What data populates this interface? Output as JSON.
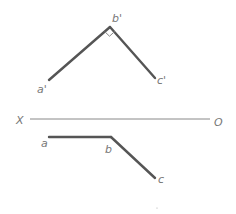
{
  "diagram": {
    "type": "orthographic projection",
    "front_view": {
      "points": [
        {
          "label": "a'",
          "x": 49,
          "y": 80
        },
        {
          "label": "b'",
          "x": 110,
          "y": 27
        },
        {
          "label": "c'",
          "x": 155,
          "y": 78
        }
      ],
      "right_angle_at": "b'"
    },
    "axis": {
      "left_label": "X",
      "right_label": "O"
    },
    "top_view": {
      "points": [
        {
          "label": "a",
          "x": 49,
          "y": 137
        },
        {
          "label": "b",
          "x": 111,
          "y": 137
        },
        {
          "label": "c",
          "x": 155,
          "y": 178
        }
      ]
    },
    "colors": {
      "line": "#555555",
      "axis": "#888888",
      "label": "#777777"
    }
  }
}
